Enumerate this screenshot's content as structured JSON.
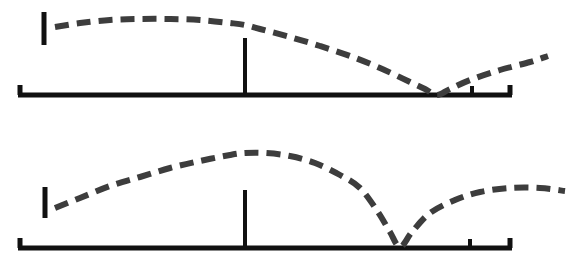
{
  "figure": {
    "background_color": "#ffffff",
    "axis_color": "#111111",
    "curve_color": "#3d3d3d",
    "panel_count": 2
  },
  "chart_data": [
    {
      "type": "line",
      "title": "",
      "subtitle": "",
      "xlabel": "",
      "ylabel": "",
      "panel": "top",
      "grid": false,
      "legend": null,
      "annotations": [],
      "axis": {
        "baseline_y": 95,
        "x_start": 18,
        "x_end": 512,
        "left_cap_tick": true,
        "right_cap_tick": true,
        "interior_ticks": [
          472
        ],
        "y_axis_segment": {
          "x": 44,
          "y_top": 12,
          "y_bottom": 45
        }
      },
      "marker_line": {
        "x": 245,
        "y_top": 38,
        "y_bottom": 95
      },
      "xlim": [
        18,
        576
      ],
      "ylim": [
        0,
        95
      ],
      "series": [
        {
          "name": "dashed-curve-top",
          "style": "dashed",
          "x": [
            55,
            80,
            110,
            140,
            170,
            200,
            230,
            245,
            260,
            290,
            320,
            350,
            380,
            410,
            425,
            437,
            450,
            470,
            500,
            530,
            548
          ],
          "y": [
            27,
            23,
            20,
            19,
            19,
            20,
            23,
            25,
            29,
            37,
            46,
            56,
            68,
            82,
            89,
            95,
            89,
            80,
            70,
            62,
            56
          ]
        }
      ]
    },
    {
      "type": "line",
      "title": "",
      "subtitle": "",
      "xlabel": "",
      "ylabel": "",
      "panel": "bottom",
      "grid": false,
      "legend": null,
      "annotations": [],
      "axis": {
        "baseline_y": 248,
        "x_start": 18,
        "x_end": 512,
        "left_cap_tick": true,
        "right_cap_tick": true,
        "interior_ticks": [
          470
        ],
        "y_axis_segment": {
          "x": 45,
          "y_top": 187,
          "y_bottom": 218
        }
      },
      "marker_line": {
        "x": 245,
        "y_top": 190,
        "y_bottom": 248
      },
      "xlim": [
        18,
        576
      ],
      "ylim": [
        0,
        248
      ],
      "series": [
        {
          "name": "dashed-curve-bottom",
          "style": "dashed",
          "x": [
            55,
            80,
            110,
            140,
            170,
            200,
            230,
            245,
            265,
            290,
            315,
            340,
            360,
            378,
            390,
            400,
            412,
            430,
            455,
            480,
            510,
            540,
            565
          ],
          "y": [
            208,
            198,
            186,
            177,
            168,
            161,
            155,
            153,
            153,
            156,
            163,
            175,
            188,
            212,
            232,
            247,
            232,
            213,
            200,
            192,
            188,
            188,
            191
          ]
        }
      ]
    }
  ],
  "panels": [
    {
      "name": "top-panel",
      "label": ""
    },
    {
      "name": "bottom-panel",
      "label": ""
    }
  ]
}
